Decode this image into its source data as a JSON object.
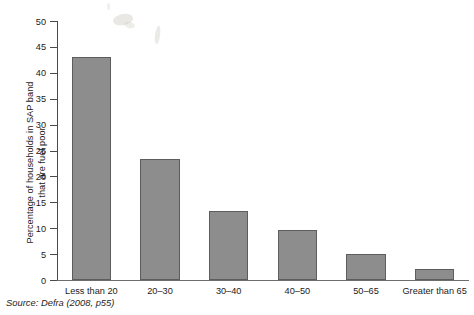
{
  "chart_data": {
    "type": "bar",
    "title": "",
    "subtitle": "",
    "xlabel": "",
    "ylabel": "Percentage of households in SAP band\nthat are fuel poor",
    "categories": [
      "Less than 20",
      "20–30",
      "30–40",
      "40–50",
      "50–65",
      "Greater than 65"
    ],
    "values": [
      43.0,
      23.3,
      13.3,
      9.7,
      5.0,
      2.1
    ],
    "ylim": [
      0,
      50
    ],
    "yticks": [
      0,
      5,
      10,
      15,
      20,
      25,
      30,
      35,
      40,
      45,
      50
    ],
    "ytick_labels": [
      "0",
      "5",
      "10",
      "15",
      "20",
      "25",
      "30",
      "35",
      "40",
      "45",
      "50"
    ],
    "grid": false,
    "legend": null,
    "series": [
      {
        "name": "Percentage of households in SAP band that are fuel poor",
        "values": [
          43.0,
          23.3,
          13.3,
          9.7,
          5.0,
          2.1
        ]
      }
    ],
    "bar_color": "#8d8d8d",
    "bar_edge_color": "#5d5d5d",
    "axis_color": "#4a4a4a",
    "background_color": "#ffffff"
  },
  "source_note": "Source: Defra (2008, p55)"
}
